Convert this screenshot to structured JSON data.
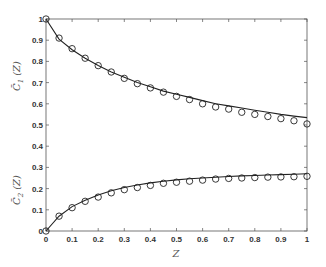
{
  "chart_data": {
    "type": "line",
    "title": "",
    "xlabel": "Z",
    "ylabel_top": "C̄₁ (Z)",
    "ylabel_bottom": "C̄₂ (Z)",
    "xlim": [
      0,
      1
    ],
    "ylim": [
      0,
      1
    ],
    "grid": false,
    "legend": "none",
    "x_ticks": [
      "0",
      "0.1",
      "0.2",
      "0.3",
      "0.4",
      "0.5",
      "0.6",
      "0.7",
      "0.8",
      "0.9",
      "1"
    ],
    "y_ticks": [
      "0",
      "0.1",
      "0.2",
      "0.3",
      "0.4",
      "0.5",
      "0.6",
      "0.7",
      "0.8",
      "0.9",
      "1"
    ],
    "x": [
      0,
      0.05,
      0.1,
      0.15,
      0.2,
      0.25,
      0.3,
      0.35,
      0.4,
      0.45,
      0.5,
      0.55,
      0.6,
      0.65,
      0.7,
      0.75,
      0.8,
      0.85,
      0.9,
      0.95,
      1.0
    ],
    "series": [
      {
        "name": "C1 model",
        "style": "solid-line",
        "values": [
          1.0,
          0.905,
          0.855,
          0.815,
          0.78,
          0.75,
          0.725,
          0.7,
          0.68,
          0.66,
          0.645,
          0.63,
          0.615,
          0.6,
          0.59,
          0.58,
          0.57,
          0.56,
          0.55,
          0.542,
          0.535
        ]
      },
      {
        "name": "C1 data",
        "style": "open-circle",
        "values": [
          1.0,
          0.91,
          0.86,
          0.815,
          0.78,
          0.75,
          0.72,
          0.695,
          0.675,
          0.655,
          0.635,
          0.62,
          0.6,
          0.585,
          0.575,
          0.56,
          0.55,
          0.54,
          0.53,
          0.52,
          0.505
        ]
      },
      {
        "name": "C2 model",
        "style": "solid-line",
        "values": [
          0.0,
          0.07,
          0.115,
          0.145,
          0.17,
          0.19,
          0.205,
          0.217,
          0.227,
          0.235,
          0.241,
          0.246,
          0.25,
          0.254,
          0.257,
          0.26,
          0.262,
          0.264,
          0.266,
          0.268,
          0.27
        ]
      },
      {
        "name": "C2 data",
        "style": "open-circle",
        "values": [
          0.0,
          0.07,
          0.11,
          0.14,
          0.16,
          0.18,
          0.195,
          0.205,
          0.215,
          0.225,
          0.23,
          0.235,
          0.24,
          0.245,
          0.248,
          0.25,
          0.252,
          0.254,
          0.255,
          0.256,
          0.258
        ]
      }
    ]
  },
  "axis": {
    "xlabel": "Z",
    "ylabel_top_main": "C̄",
    "ylabel_top_sub": "1",
    "ylabel_bottom_main": "C̄",
    "ylabel_bottom_sub": "2",
    "ylabel_arg": "(Z)"
  }
}
